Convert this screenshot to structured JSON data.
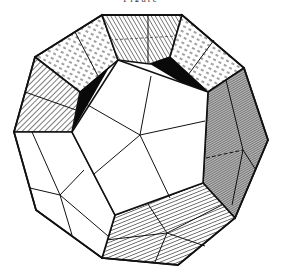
{
  "figure": {
    "top_caption": "Figure",
    "colors": {
      "stroke": "#111111",
      "background": "#ffffff",
      "face_white": "#ffffff",
      "dark_gap": "#0a0a0a",
      "shade_dense": "#555555"
    }
  }
}
